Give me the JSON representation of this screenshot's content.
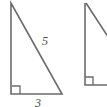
{
  "diagram": {
    "background_color": "#ffffff",
    "stroke_color": "#6b6b6b",
    "label_color": "#4a4a4a",
    "stroke_width": 1.6,
    "figures": [
      {
        "id": "triangle-1",
        "name": "left-right-triangle",
        "clipped": false,
        "vertices": {
          "apex": [
            11,
            3
          ],
          "right_angle": [
            11,
            94
          ],
          "base_end": [
            62,
            94
          ]
        },
        "right_angle_marker": {
          "x": 12,
          "y": 86,
          "size": 8
        },
        "labels": {
          "hypotenuse": "5",
          "base": "3"
        }
      },
      {
        "id": "triangle-2",
        "name": "right-right-triangle",
        "clipped": true,
        "vertices": {
          "apex": [
            85,
            3
          ],
          "right_angle": [
            85,
            85
          ],
          "base_end": [
            107,
            85
          ]
        },
        "right_angle_marker": {
          "x": 85,
          "y": 77,
          "size": 8
        },
        "labels": {
          "hypotenuse": "",
          "base": ""
        }
      }
    ]
  },
  "labels": {
    "hypotenuse_left": "5",
    "base_left": "3"
  }
}
